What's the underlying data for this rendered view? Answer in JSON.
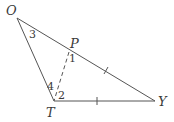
{
  "diagram": {
    "type": "triangle",
    "colors": {
      "line": "#555555",
      "text": "#3a3a3a",
      "background": "#ffffff"
    },
    "vertices": {
      "O": {
        "label": "O",
        "x": 17,
        "y": 18
      },
      "T": {
        "label": "T",
        "x": 54,
        "y": 101
      },
      "Y": {
        "label": "Y",
        "x": 155,
        "y": 101
      },
      "P": {
        "label": "P",
        "x": 69,
        "y": 52
      }
    },
    "segments": [
      {
        "from": "O",
        "to": "T",
        "style": "solid"
      },
      {
        "from": "O",
        "to": "Y",
        "style": "solid"
      },
      {
        "from": "T",
        "to": "Y",
        "style": "solid"
      },
      {
        "from": "P",
        "to": "T",
        "style": "dashed"
      }
    ],
    "congruence_marks": [
      {
        "segment": "PY",
        "ticks": 1
      },
      {
        "segment": "TY",
        "ticks": 1
      }
    ],
    "angle_labels": [
      {
        "label": "3",
        "at": "O"
      },
      {
        "label": "1",
        "at": "P"
      },
      {
        "label": "4",
        "at": "T"
      },
      {
        "label": "2",
        "at": "T"
      }
    ]
  },
  "labels": {
    "O": "O",
    "P": "P",
    "T": "T",
    "Y": "Y",
    "angle1": "1",
    "angle2": "2",
    "angle3": "3",
    "angle4": "4"
  }
}
